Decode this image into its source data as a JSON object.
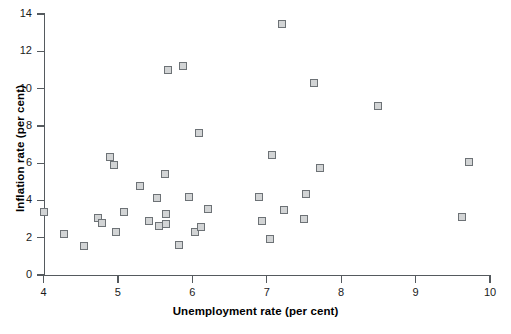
{
  "chart_data": {
    "type": "scatter",
    "title": "",
    "xlabel": "Unemployment rate (per cent)",
    "ylabel": "Inflation rate (per cent)",
    "xlim": [
      4,
      10
    ],
    "ylim": [
      0,
      14
    ],
    "xticks": [
      4,
      5,
      6,
      7,
      8,
      9,
      10
    ],
    "yticks": [
      0,
      2,
      4,
      6,
      8,
      10,
      12,
      14
    ],
    "xtick_labels": [
      "4",
      "5",
      "6",
      "7",
      "8",
      "9",
      "10"
    ],
    "ytick_labels": [
      "0",
      "2",
      "4",
      "6",
      "8",
      "10",
      "12",
      "14"
    ],
    "grid": false,
    "legend": null,
    "marker": "square",
    "marker_face_color": "#d2d4d5",
    "marker_edge_color": "#6d7276",
    "axis_color": "#555a5e",
    "points": [
      {
        "x": 4.0,
        "y": 3.38
      },
      {
        "x": 4.27,
        "y": 2.18
      },
      {
        "x": 4.55,
        "y": 1.58
      },
      {
        "x": 4.73,
        "y": 3.05
      },
      {
        "x": 4.78,
        "y": 2.8
      },
      {
        "x": 4.89,
        "y": 6.32
      },
      {
        "x": 4.95,
        "y": 5.88
      },
      {
        "x": 4.98,
        "y": 2.32
      },
      {
        "x": 5.08,
        "y": 3.37
      },
      {
        "x": 5.3,
        "y": 4.78
      },
      {
        "x": 5.42,
        "y": 2.88
      },
      {
        "x": 5.52,
        "y": 4.12
      },
      {
        "x": 5.55,
        "y": 2.62
      },
      {
        "x": 5.63,
        "y": 5.4
      },
      {
        "x": 5.64,
        "y": 2.75
      },
      {
        "x": 5.65,
        "y": 3.28
      },
      {
        "x": 5.67,
        "y": 11.0
      },
      {
        "x": 5.82,
        "y": 1.62
      },
      {
        "x": 5.88,
        "y": 11.22
      },
      {
        "x": 5.96,
        "y": 4.2
      },
      {
        "x": 6.03,
        "y": 2.28
      },
      {
        "x": 6.09,
        "y": 7.6
      },
      {
        "x": 6.12,
        "y": 2.55
      },
      {
        "x": 6.21,
        "y": 3.55
      },
      {
        "x": 6.9,
        "y": 4.18
      },
      {
        "x": 6.94,
        "y": 2.92
      },
      {
        "x": 7.04,
        "y": 1.93
      },
      {
        "x": 7.07,
        "y": 6.44
      },
      {
        "x": 7.2,
        "y": 13.48
      },
      {
        "x": 7.23,
        "y": 3.48
      },
      {
        "x": 7.5,
        "y": 2.98
      },
      {
        "x": 7.53,
        "y": 4.32
      },
      {
        "x": 7.63,
        "y": 10.32
      },
      {
        "x": 7.72,
        "y": 5.75
      },
      {
        "x": 8.5,
        "y": 9.08
      },
      {
        "x": 9.62,
        "y": 3.1
      },
      {
        "x": 9.72,
        "y": 6.08
      }
    ]
  }
}
